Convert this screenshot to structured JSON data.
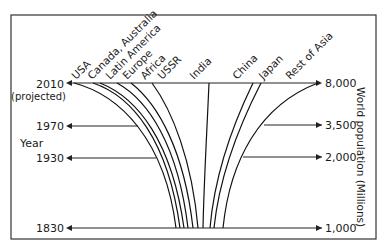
{
  "year_axis": {
    "label": "Year",
    "ticks": [
      {
        "label": "2010",
        "y": 83
      },
      {
        "label": "1970",
        "y": 126
      },
      {
        "label": "1930",
        "y": 158
      },
      {
        "label": "1830",
        "y": 228
      }
    ],
    "projected_note": "(projected)"
  },
  "population_axis": {
    "label": "World population (Millions)",
    "ticks": [
      {
        "label": "8,000",
        "y": 83
      },
      {
        "label": "3,500",
        "y": 125
      },
      {
        "label": "2,000",
        "y": 157
      },
      {
        "label": "1,000",
        "y": 228
      }
    ]
  },
  "regions": [
    {
      "name": "USA",
      "top_x": 74,
      "bottom_x": 176
    },
    {
      "name": "Canada, Australia",
      "top_x": 93,
      "bottom_x": 180
    },
    {
      "name": "Latin America",
      "top_x": 100,
      "bottom_x": 184
    },
    {
      "name": "Europe",
      "top_x": 117,
      "bottom_x": 188
    },
    {
      "name": "Africa",
      "top_x": 131,
      "bottom_x": 193
    },
    {
      "name": "USSR",
      "top_x": 152,
      "bottom_x": 198
    },
    {
      "name": "India",
      "top_x": 209,
      "bottom_x": 203
    },
    {
      "name": "China",
      "top_x": 253,
      "bottom_x": 210
    },
    {
      "name": "Japan",
      "top_x": 261,
      "bottom_x": 214
    },
    {
      "name": "Rest of Asia",
      "top_x": 318,
      "bottom_x": 223
    }
  ]
}
